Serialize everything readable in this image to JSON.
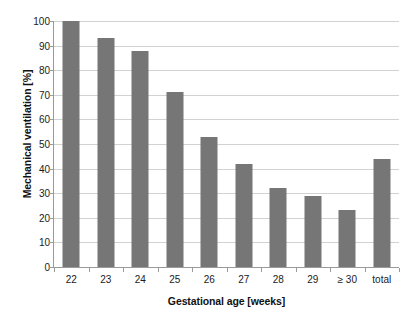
{
  "chart_data": {
    "type": "bar",
    "title": "",
    "subtitle": "",
    "xlabel": "Gestational age [weeks]",
    "ylabel": "Mechanical ventilation [%]",
    "categories": [
      "22",
      "23",
      "24",
      "25",
      "26",
      "27",
      "28",
      "29",
      "≥ 30",
      "total"
    ],
    "values": [
      100,
      93,
      88,
      71,
      53,
      42,
      32,
      29,
      23,
      44
    ],
    "series": [
      {
        "name": "Mechanical ventilation",
        "values": [
          100,
          93,
          88,
          71,
          53,
          42,
          32,
          29,
          23,
          44
        ]
      }
    ],
    "ylim": [
      0,
      100
    ],
    "ytick_labels": [
      "0",
      "10",
      "20",
      "30",
      "40",
      "50",
      "60",
      "70",
      "80",
      "90",
      "100"
    ],
    "ytick_values": [
      0,
      10,
      20,
      30,
      40,
      50,
      60,
      70,
      80,
      90,
      100
    ],
    "grid": "horizontal",
    "legend": "none",
    "bar_color": "#767676",
    "gridline_color": "#d2d2d2",
    "axis_color": "#9a9a9a",
    "background_color": "#ffffff",
    "text_color": "#1a1a1a"
  }
}
